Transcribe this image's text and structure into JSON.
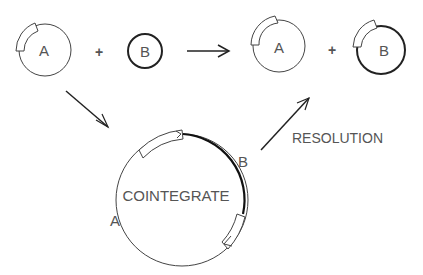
{
  "diagram": {
    "type": "plasmid-cointegrate-resolution",
    "colors": {
      "line": "#333333",
      "text": "#555555",
      "background": "#ffffff"
    },
    "reactants": {
      "plasmid_a_label": "A",
      "plus_1": "+",
      "plasmid_b_label": "B"
    },
    "products": {
      "plasmid_a_label": "A",
      "plus_2": "+",
      "plasmid_b_label": "B"
    },
    "cointegrate": {
      "center_label": "COINTEGRATE",
      "segment_a_label": "A",
      "segment_b_label": "B"
    },
    "resolution_label": "RESOLUTION"
  }
}
